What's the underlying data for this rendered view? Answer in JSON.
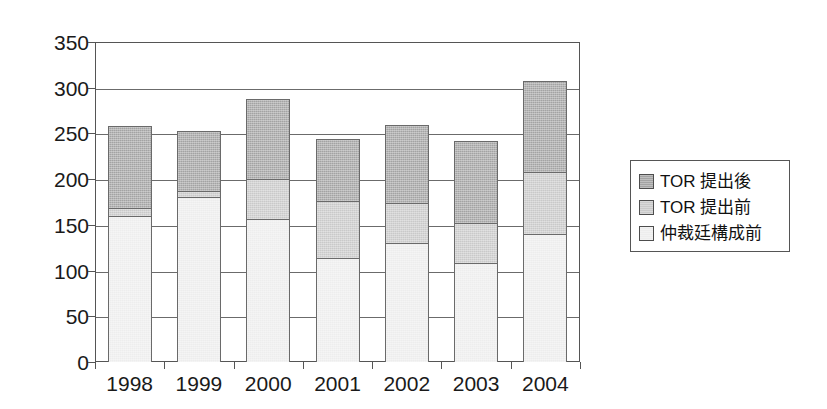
{
  "chart_data": {
    "type": "bar",
    "title": "",
    "subtitle": "",
    "xlabel": "",
    "ylabel": "",
    "stacked": true,
    "grid": true,
    "legend_position": "right",
    "ylim": [
      0,
      350
    ],
    "yticks": [
      0,
      50,
      100,
      150,
      200,
      250,
      300,
      350
    ],
    "ytick_labels": [
      "0",
      "50",
      "100",
      "150",
      "200",
      "250",
      "300",
      "350"
    ],
    "categories": [
      "1998",
      "1999",
      "2000",
      "2001",
      "2002",
      "2003",
      "2004"
    ],
    "series": [
      {
        "name": "仲裁廷構成前",
        "color": "#ededed",
        "values": [
          160,
          180,
          156,
          114,
          130,
          108,
          140
        ]
      },
      {
        "name": "TOR 提出前",
        "color": "#c9c9c9",
        "values": [
          8,
          7,
          44,
          62,
          44,
          44,
          68
        ]
      },
      {
        "name": "TOR 提出後",
        "color": "#a3a3a3",
        "values": [
          90,
          66,
          88,
          68,
          85,
          90,
          99
        ]
      }
    ],
    "totals": [
      258,
      253,
      288,
      244,
      259,
      242,
      307
    ]
  },
  "legend": {
    "items": [
      {
        "label": "TOR 提出後",
        "swatch": "#a3a3a3"
      },
      {
        "label": "TOR 提出前",
        "swatch": "#c9c9c9"
      },
      {
        "label": "仲裁廷構成前",
        "swatch": "#ededed"
      }
    ]
  }
}
